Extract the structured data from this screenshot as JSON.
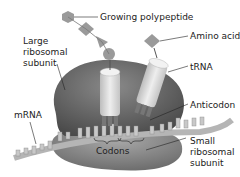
{
  "diagram": {
    "labels": {
      "growing_polypeptide": "Growing polypeptide",
      "amino_acid": "Amino acid",
      "large_subunit_1": "Large",
      "large_subunit_2": "ribosomal",
      "large_subunit_3": "subunit",
      "trna": "tRNA",
      "anticodon": "Anticodon",
      "mrna": "mRNA",
      "codons": "Codons",
      "small_subunit_1": "Small",
      "small_subunit_2": "ribosomal",
      "small_subunit_3": "subunit"
    },
    "colors": {
      "large_subunit": "#6e6e6e",
      "small_subunit": "#8a8a8a",
      "trna": "#d9d9d9",
      "polypeptide": "#9a9a9a",
      "mrna": "#b5b5b5",
      "leader_line": "#222222"
    }
  }
}
